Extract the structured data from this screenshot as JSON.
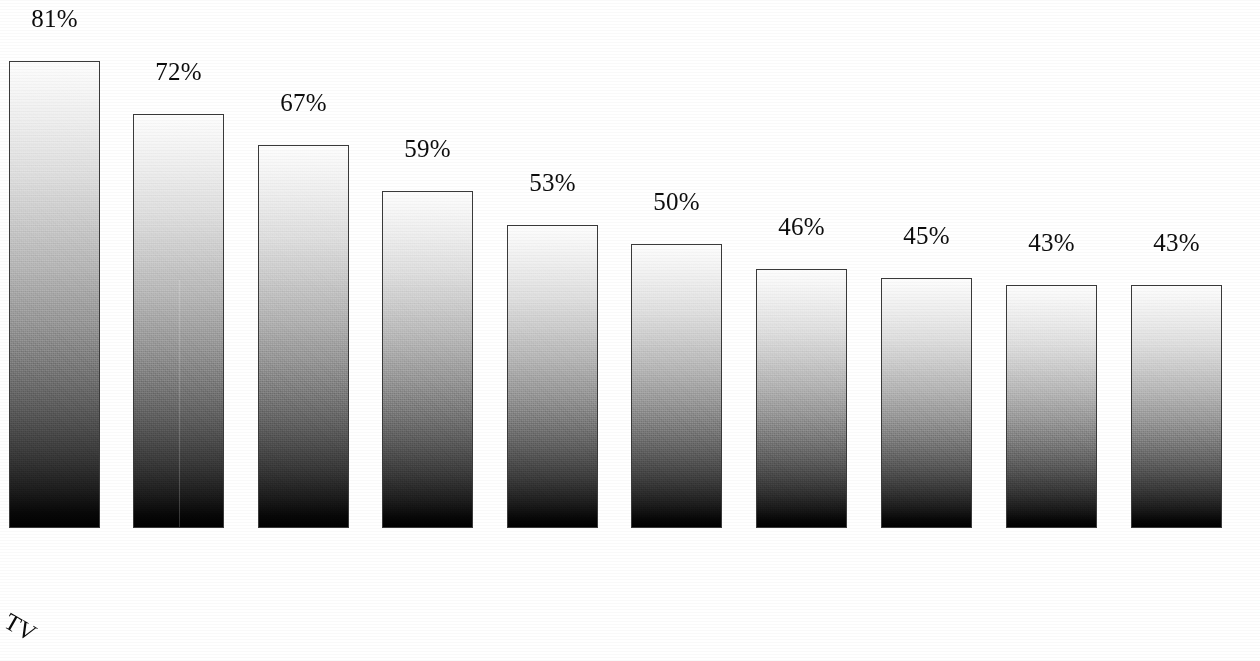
{
  "chart_data": {
    "type": "bar",
    "title": "",
    "subtitle": "",
    "xlabel": "",
    "ylabel": "",
    "ylim": [
      0,
      100
    ],
    "grid": false,
    "legend": null,
    "value_suffix": "%",
    "categories": [
      "TV",
      "Objects",
      "Music",
      "Toys",
      "Collections",
      "Animals",
      "Construction",
      "Transportation",
      "Art",
      "Machines"
    ],
    "values": [
      81,
      72,
      67,
      59,
      53,
      50,
      46,
      45,
      43,
      43
    ],
    "value_labels": [
      "81%",
      "72%",
      "67%",
      "59%",
      "53%",
      "50%",
      "46%",
      "45%",
      "43%",
      "43%"
    ],
    "bars": [
      {
        "category": "TV",
        "value": 81,
        "label": "81%",
        "x": 9,
        "width": 91,
        "height": 467
      },
      {
        "category": "Objects",
        "value": 72,
        "label": "72%",
        "x": 133,
        "width": 91,
        "height": 414,
        "seam": true
      },
      {
        "category": "Music",
        "value": 67,
        "label": "67%",
        "x": 258,
        "width": 91,
        "height": 383
      },
      {
        "category": "Toys",
        "value": 59,
        "label": "59%",
        "x": 382,
        "width": 91,
        "height": 337
      },
      {
        "category": "Collections",
        "value": 53,
        "label": "53%",
        "x": 507,
        "width": 91,
        "height": 303
      },
      {
        "category": "Animals",
        "value": 50,
        "label": "50%",
        "x": 631,
        "width": 91,
        "height": 284
      },
      {
        "category": "Construction",
        "value": 46,
        "label": "46%",
        "x": 756,
        "width": 91,
        "height": 259
      },
      {
        "category": "Transportation",
        "value": 45,
        "label": "45%",
        "x": 881,
        "width": 91,
        "height": 250
      },
      {
        "category": "Art",
        "value": 43,
        "label": "43%",
        "x": 1006,
        "width": 91,
        "height": 243
      },
      {
        "category": "Machines",
        "value": 43,
        "label": "43%",
        "x": 1131,
        "width": 91,
        "height": 243
      }
    ],
    "colors": {
      "background": "#ffffff",
      "bar_top": "#fdfdfd",
      "bar_bottom": "#000000",
      "bar_border": "#3a3a3a",
      "text": "#0d0d0d"
    }
  }
}
